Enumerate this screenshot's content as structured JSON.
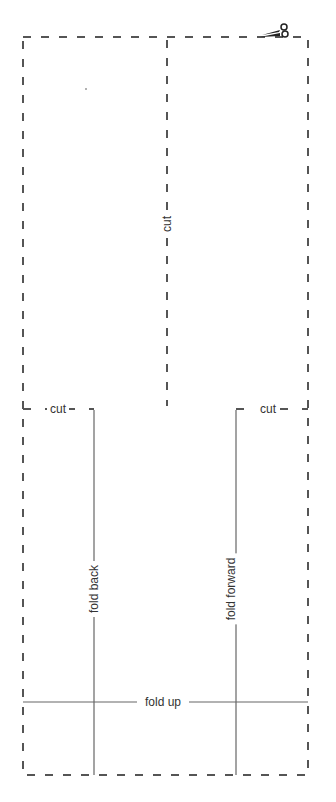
{
  "diagram": {
    "type": "paper cut-and-fold template",
    "labels": {
      "center_cut": "cut",
      "left_cut": "cut",
      "right_cut": "cut",
      "fold_back": "fold back",
      "fold_forward": "fold forward",
      "fold_up": "fold up"
    },
    "icons": [
      "scissors-icon"
    ],
    "colors": {
      "dashed_line": "#555555",
      "solid_line": "#666666",
      "text": "#333333",
      "background": "#ffffff"
    }
  }
}
